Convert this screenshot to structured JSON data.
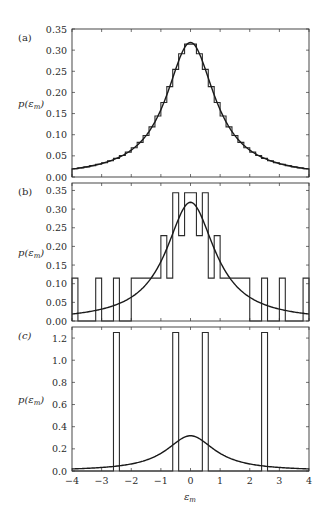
{
  "chart_data": [
    {
      "type": "bar",
      "panel_label": "(a)",
      "title": "",
      "xlabel": "",
      "ylabel": "p(ε_m)",
      "xlim": [
        -4,
        4
      ],
      "ylim": [
        0,
        0.35
      ],
      "xticks": [
        -4,
        -3,
        -2,
        -1,
        0,
        1,
        2,
        3,
        4
      ],
      "yticks": [
        0.0,
        0.05,
        0.1,
        0.15,
        0.2,
        0.25,
        0.3,
        0.35
      ],
      "ytick_labels": [
        "0.00",
        "0.05",
        "0.10",
        "0.15",
        "0.20",
        "0.25",
        "0.30",
        "0.35"
      ],
      "histogram": {
        "bin_width": 0.2,
        "description": "fine histogram closely following Cauchy density",
        "source": "lorentzian_bin_averages"
      },
      "curve": {
        "name": "Cauchy density 1/(π(1+x²))",
        "peak": 0.318
      },
      "grid": false
    },
    {
      "type": "bar",
      "panel_label": "(b)",
      "xlabel": "",
      "ylabel": "p(ε_m)",
      "xlim": [
        -4,
        4
      ],
      "ylim": [
        0,
        0.37
      ],
      "yticks": [
        0.0,
        0.05,
        0.1,
        0.15,
        0.2,
        0.25,
        0.3,
        0.35
      ],
      "ytick_labels": [
        "0.00",
        "0.05",
        "0.10",
        "0.15",
        "0.20",
        "0.25",
        "0.30",
        "0.35"
      ],
      "histogram": {
        "edges": [
          -4.0,
          -3.8,
          -3.2,
          -3.0,
          -2.6,
          -2.4,
          -2.0,
          -1.0,
          -0.8,
          -0.6,
          -0.4,
          -0.2,
          0.2,
          0.4,
          0.6,
          0.8,
          1.0,
          2.0,
          2.4,
          2.6,
          3.0,
          3.2,
          3.8,
          4.0
        ],
        "heights": [
          0.115,
          0.0,
          0.115,
          0.0,
          0.115,
          0.0,
          0.115,
          0.229,
          0.115,
          0.344,
          0.229,
          0.344,
          0.229,
          0.344,
          0.115,
          0.229,
          0.115,
          0.0,
          0.115,
          0.0,
          0.115,
          0.0,
          0.115
        ]
      },
      "curve": {
        "name": "Cauchy density 1/(π(1+x²))",
        "peak": 0.318
      },
      "grid": false
    },
    {
      "type": "bar",
      "panel_label": "(c)",
      "xlabel": "ε_m",
      "ylabel": "p(ε_m)",
      "xlim": [
        -4,
        4
      ],
      "ylim": [
        0,
        1.3
      ],
      "xticks": [
        -4,
        -3,
        -2,
        -1,
        0,
        1,
        2,
        3,
        4
      ],
      "xtick_labels": [
        "−4",
        "−3",
        "−2",
        "−1",
        "0",
        "1",
        "2",
        "3",
        "4"
      ],
      "yticks": [
        0.0,
        0.2,
        0.4,
        0.6,
        0.8,
        1.0,
        1.2
      ],
      "ytick_labels": [
        "0.0",
        "0.2",
        "0.4",
        "0.6",
        "0.8",
        "1.0",
        "1.2"
      ],
      "histogram": {
        "edges": [
          -4.0,
          -2.6,
          -2.4,
          -0.6,
          -0.4,
          0.4,
          0.6,
          2.4,
          2.6,
          4.0
        ],
        "heights": [
          0.0,
          1.25,
          0.0,
          1.25,
          0.0,
          1.25,
          0.0,
          1.25,
          0.0
        ]
      },
      "curve": {
        "name": "Cauchy density 1/(π(1+x²))",
        "peak": 0.318
      },
      "grid": false
    }
  ],
  "figure": {
    "panels": [
      {
        "label": "(a)",
        "ylabel": "p(ε_m)"
      },
      {
        "label": "(b)",
        "ylabel": "p(ε_m)"
      },
      {
        "label": "(c)",
        "ylabel": "p(ε_m)"
      }
    ],
    "xlabel": "ε_m",
    "colors": {
      "axes": "#333333",
      "lines": "#1a1a1a",
      "background": "#ffffff"
    }
  }
}
